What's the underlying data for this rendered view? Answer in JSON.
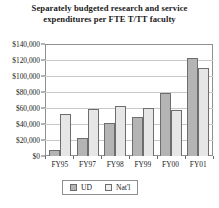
{
  "chart_data": {
    "type": "bar",
    "title": "Separately budgeted research and service expenditures per FTE T/TT faculty",
    "title_line1": "Separately budgeted research and service",
    "title_line2": "expenditures per FTE T/TT faculty",
    "xlabel": "",
    "ylabel": "",
    "categories": [
      "FY95",
      "FY97",
      "FY98",
      "FY99",
      "FY00",
      "FY01"
    ],
    "ylim": [
      0,
      140000
    ],
    "ytick_values": [
      0,
      20000,
      40000,
      60000,
      80000,
      100000,
      120000,
      140000
    ],
    "ytick_labels": [
      "$0",
      "$20,000",
      "$40,000",
      "$60,000",
      "$80,000",
      "$100,000",
      "$120,000",
      "$140,000"
    ],
    "grid": true,
    "legend_position": "bottom-center",
    "series": [
      {
        "name": "UD",
        "color": "#b4b4b4",
        "values": [
          7000,
          23000,
          41000,
          49000,
          79000,
          123000
        ]
      },
      {
        "name": "Nat'l",
        "color": "#e6e6e6",
        "values": [
          52000,
          59000,
          63000,
          60000,
          58000,
          110000
        ]
      }
    ]
  },
  "legend": {
    "items": [
      {
        "label": "UD"
      },
      {
        "label": "Nat'l"
      }
    ]
  }
}
